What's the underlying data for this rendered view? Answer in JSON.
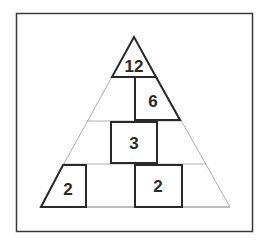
{
  "diagram": {
    "type": "number-pyramid",
    "rows": [
      {
        "row": 1,
        "cells": [
          {
            "position": "apex",
            "value": "12"
          }
        ]
      },
      {
        "row": 2,
        "cells": [
          {
            "position": "left",
            "value": ""
          },
          {
            "position": "right",
            "value": "6"
          }
        ]
      },
      {
        "row": 3,
        "cells": [
          {
            "position": "left",
            "value": ""
          },
          {
            "position": "center",
            "value": "3"
          },
          {
            "position": "right",
            "value": ""
          }
        ]
      },
      {
        "row": 4,
        "cells": [
          {
            "position": "1",
            "value": "2"
          },
          {
            "position": "2",
            "value": ""
          },
          {
            "position": "3",
            "value": "2"
          },
          {
            "position": "4",
            "value": ""
          }
        ]
      }
    ],
    "labels": {
      "apex": "12",
      "row2_right": "6",
      "row3_center": "3",
      "row4_left": "2",
      "row4_third": "2"
    },
    "colors": {
      "frame": "#3a3a3a",
      "thin_line": "#9a9a9a",
      "box_border": "#2a2a2a",
      "text": "#2a2a2a",
      "background": "#ffffff"
    }
  }
}
